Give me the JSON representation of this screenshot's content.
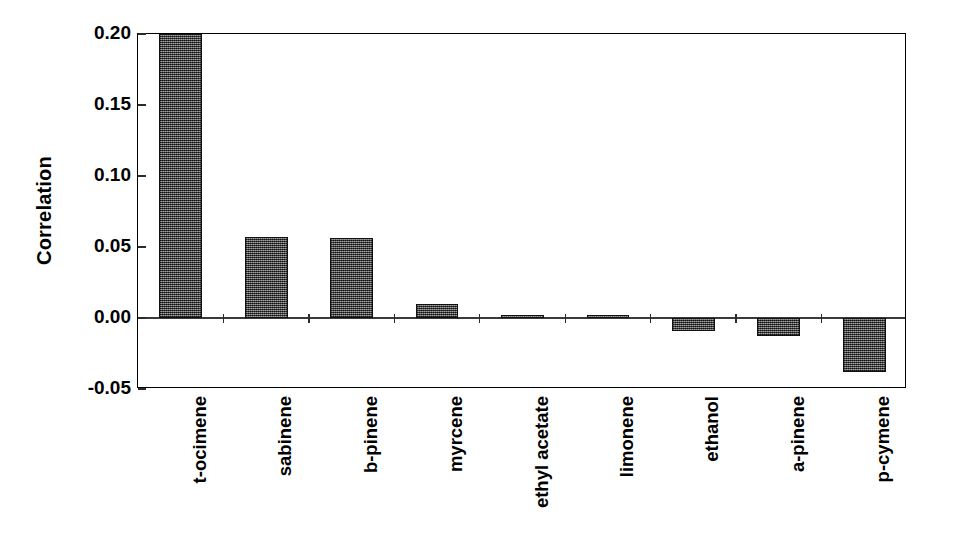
{
  "chart_data": {
    "type": "bar",
    "title": "",
    "subtitle": "",
    "xlabel": "",
    "ylabel": "Correlation",
    "categories": [
      "t-ocimene",
      "sabinene",
      "b-pinene",
      "myrcene",
      "ethyl acetate",
      "limonene",
      "ethanol",
      "a-pinene",
      "p-cymene"
    ],
    "values": [
      0.2,
      0.057,
      0.056,
      0.01,
      0.002,
      0.002,
      -0.009,
      -0.013,
      -0.038
    ],
    "ylim": [
      -0.05,
      0.2
    ],
    "yticks": [
      0.2,
      0.15,
      0.1,
      0.05,
      0.0,
      -0.05
    ],
    "ytick_labels": [
      "0.20",
      "0.15",
      "0.10",
      "0.05",
      "0.00",
      "-0.05"
    ],
    "grid": false,
    "legend": null,
    "bar_color": "#555555",
    "bar_edge_color": "#111111",
    "axis_color": "#000000",
    "background_color": "#ffffff",
    "baseline": 0.0
  }
}
